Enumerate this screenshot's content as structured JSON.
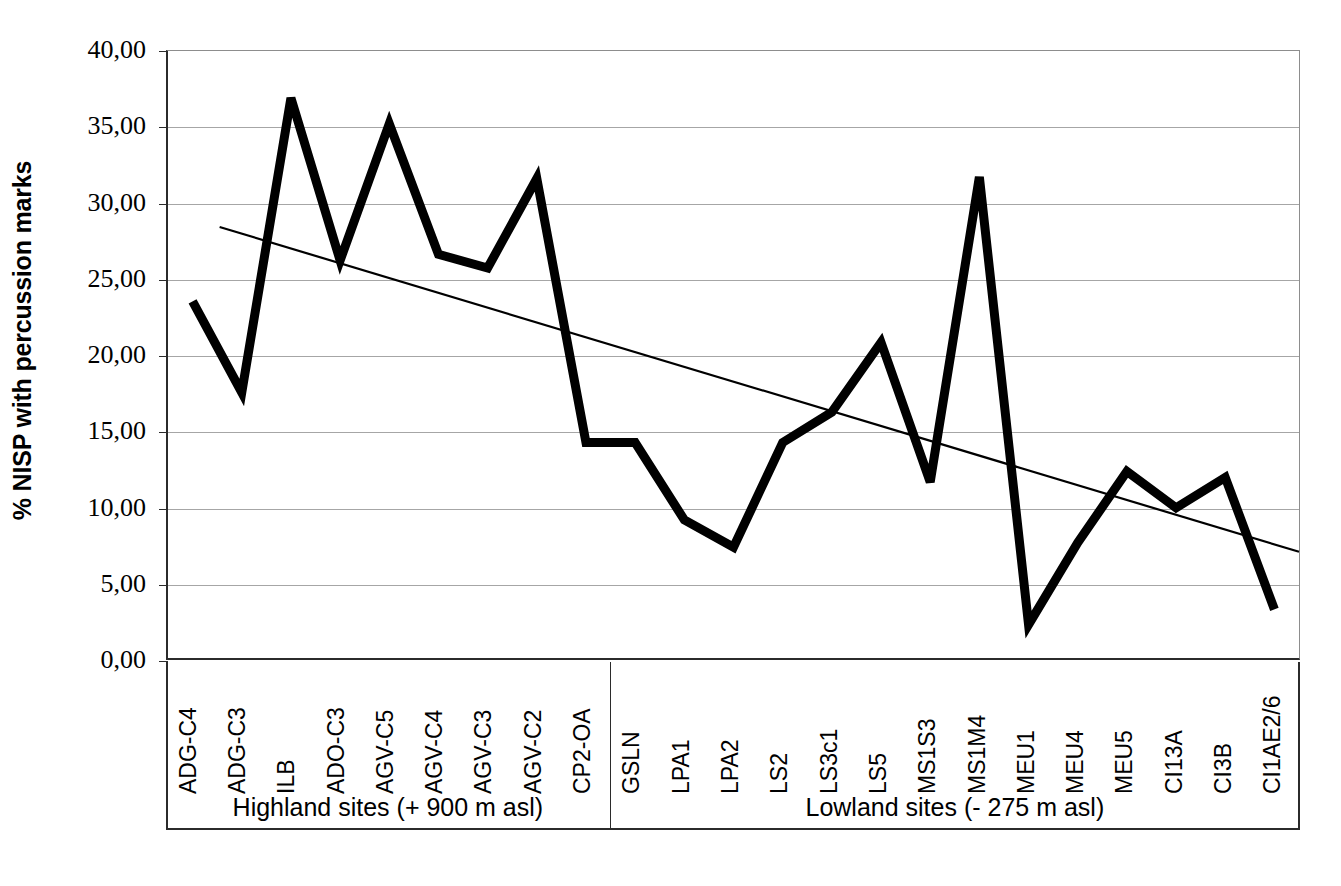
{
  "chart_data": {
    "type": "line",
    "title": "",
    "xlabel": "",
    "ylabel": "% NISP with percussion marks",
    "ylim": [
      0,
      40
    ],
    "ytick_values": [
      0,
      5,
      10,
      15,
      20,
      25,
      30,
      35,
      40
    ],
    "ytick_labels": [
      "0,00",
      "5,00",
      "10,00",
      "15,00",
      "20,00",
      "25,00",
      "30,00",
      "35,00",
      "40,00"
    ],
    "grid": "horizontal",
    "legend": "none",
    "categories": [
      "ADG-C4",
      "ADG-C3",
      "ILB",
      "ADO-C3",
      "AGV-C5",
      "AGV-C4",
      "AGV-C3",
      "AGV-C2",
      "CP2-OA",
      "GSLN",
      "LPA1",
      "LPA2",
      "LS2",
      "LS3c1",
      "LS5",
      "MS1S3",
      "MS1M4",
      "MEU1",
      "MEU4",
      "MEU5",
      "CI13A",
      "CI3B",
      "CI1AE2/6"
    ],
    "series": [
      {
        "name": "% NISP with percussion marks",
        "color": "#000000",
        "line_width": 9,
        "values": [
          23.5,
          17.5,
          36.9,
          26.2,
          35.2,
          26.6,
          25.7,
          31.6,
          14.2,
          14.2,
          9.1,
          7.3,
          14.2,
          16.2,
          20.8,
          11.6,
          31.7,
          2.2,
          7.6,
          12.3,
          9.9,
          11.9,
          3.2
        ]
      }
    ],
    "trendline": {
      "name": "linear trendline",
      "color": "#000000",
      "line_width": 2,
      "start_value": 28.4,
      "end_value": 7.0,
      "start_category_index": 0.55,
      "end_category_index": 22.5
    },
    "groups": [
      {
        "label": "Highland sites (+ 900 m asl)",
        "start_index": 0,
        "end_index": 8,
        "count": 9
      },
      {
        "label": "Lowland sites (- 275 m asl)",
        "start_index": 9,
        "end_index": 22,
        "count": 14
      }
    ]
  },
  "caption": {
    "text": ""
  }
}
